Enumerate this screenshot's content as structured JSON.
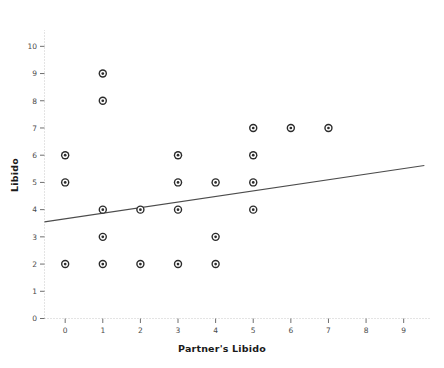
{
  "chart_data": {
    "type": "scatter",
    "title": "",
    "xlabel": "Partner's Libido",
    "ylabel": "Libido",
    "xlim": [
      -0.55,
      9.7
    ],
    "ylim": [
      0,
      10.6
    ],
    "xticks": [
      0,
      1,
      2,
      3,
      4,
      5,
      6,
      7,
      8,
      9
    ],
    "yticks": [
      0,
      1,
      2,
      3,
      4,
      5,
      6,
      7,
      8,
      9,
      10
    ],
    "xtick_labels": [
      "0",
      "1",
      "2",
      "3",
      "4",
      "5",
      "6",
      "7",
      "8",
      "9"
    ],
    "ytick_labels": [
      "0",
      "1",
      "2",
      "3",
      "4",
      "5",
      "6",
      "7",
      "8",
      "9",
      "10"
    ],
    "grid": false,
    "legend": "none",
    "marker": "open-circle",
    "marker_color": "#2b2b2b",
    "line_color": "#4c4c4c",
    "points": [
      {
        "x": 0,
        "y": 6
      },
      {
        "x": 0,
        "y": 5
      },
      {
        "x": 0,
        "y": 2
      },
      {
        "x": 1,
        "y": 9
      },
      {
        "x": 1,
        "y": 8
      },
      {
        "x": 1,
        "y": 4
      },
      {
        "x": 1,
        "y": 3
      },
      {
        "x": 1,
        "y": 2
      },
      {
        "x": 2,
        "y": 4
      },
      {
        "x": 2,
        "y": 2
      },
      {
        "x": 3,
        "y": 6
      },
      {
        "x": 3,
        "y": 5
      },
      {
        "x": 3,
        "y": 4
      },
      {
        "x": 3,
        "y": 2
      },
      {
        "x": 4,
        "y": 5
      },
      {
        "x": 4,
        "y": 3
      },
      {
        "x": 4,
        "y": 2
      },
      {
        "x": 5,
        "y": 7
      },
      {
        "x": 5,
        "y": 6
      },
      {
        "x": 5,
        "y": 5
      },
      {
        "x": 5,
        "y": 4
      },
      {
        "x": 6,
        "y": 7
      },
      {
        "x": 7,
        "y": 7
      }
    ],
    "fit_line": {
      "x_start": -0.55,
      "y_start": 3.55,
      "x_end": 9.55,
      "y_end": 5.62,
      "slope": 0.205,
      "intercept": 3.663
    }
  }
}
